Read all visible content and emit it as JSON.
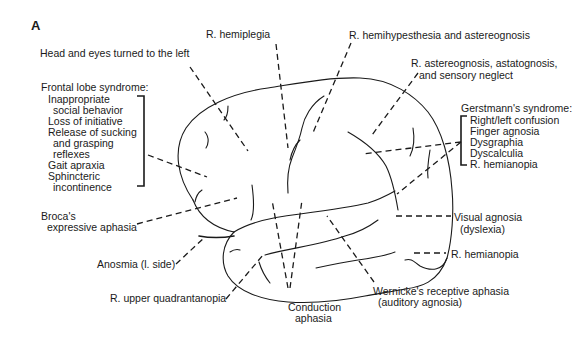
{
  "figure": {
    "panel_letter": "A",
    "colors": {
      "ink": "#1a1a1a",
      "background": "#ffffff"
    }
  },
  "labels": {
    "head_eyes": "Head and eyes turned to the left",
    "r_hemiplegia": "R. hemiplegia",
    "r_hemihypesthesia": "R. hemihypesthesia and astereognosis",
    "r_astereognosis_line1": "R. astereognosis, astatognosis,",
    "r_astereognosis_line2": "and  sensory neglect",
    "frontal": {
      "title": "Frontal lobe syndrome:",
      "items": [
        "Inappropriate",
        "social behavior",
        "Loss of initiative",
        "Release of sucking",
        "and grasping",
        "reflexes",
        "Gait apraxia",
        "Sphincteric",
        "incontinence"
      ]
    },
    "gerstmann": {
      "title": "Gerstmann's syndrome:",
      "items": [
        "Right/left confusion",
        "Finger agnosia",
        "Dysgraphia",
        "Dyscalculia",
        "R. hemianopia"
      ]
    },
    "broca_line1": "Broca's",
    "broca_line2": "expressive  aphasia",
    "anosmia": "Anosmia (l. side)",
    "r_upper_quad": "R. upper quadrantanopia",
    "conduction_line1": "Conduction",
    "conduction_line2": "aphasia",
    "wernicke_line1": "Wernicke's receptive aphasia",
    "wernicke_line2": "(auditory agnosia)",
    "visual_agnosia_line1": "Visual agnosia",
    "visual_agnosia_line2": "(dyslexia)",
    "r_hemianopia_bottom": "R. hemianopia"
  }
}
